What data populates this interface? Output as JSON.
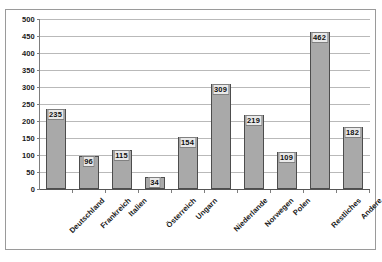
{
  "chart_data": {
    "type": "bar",
    "title": "",
    "subtitle": "",
    "xlabel": "",
    "ylabel": "",
    "ylim": [
      0,
      500
    ],
    "ytick_step": 50,
    "yticks": [
      0,
      50,
      100,
      150,
      200,
      250,
      300,
      350,
      400,
      450,
      500
    ],
    "grid": "horizontal",
    "legend": "none",
    "data_labels": true,
    "categories": [
      "Deutschland",
      "Frankreich",
      "Italien",
      "Österreich",
      "Ungarn",
      "Niederlande",
      "Norwegen",
      "Polen",
      "Restliches",
      "Andere"
    ],
    "values": [
      235,
      96,
      115,
      34,
      154,
      309,
      219,
      109,
      462,
      182
    ],
    "series": [
      {
        "name": "",
        "values": [
          235,
          96,
          115,
          34,
          154,
          309,
          219,
          109,
          462,
          182
        ],
        "color": "#a9a9a9"
      }
    ]
  },
  "colors": {
    "bar_fill": "#a9a9a9",
    "bar_border": "#4d4d4d",
    "gridline": "#b9b9b9",
    "axis": "#555555",
    "frame": "#9a9a9a",
    "plot_background": "#ffffff",
    "label_background": "#e9e9e9",
    "text": "#1a1a1a"
  }
}
